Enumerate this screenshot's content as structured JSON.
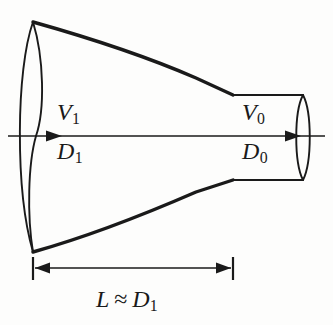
{
  "figure": {
    "background_color": "#fdfdfc",
    "line_color": "#1a1a1a"
  },
  "labels": {
    "inlet_velocity": {
      "symbol": "V",
      "subscript": "1",
      "text": "V1"
    },
    "inlet_diameter": {
      "symbol": "D",
      "subscript": "1",
      "text": "D1"
    },
    "outlet_velocity": {
      "symbol": "V",
      "subscript": "0",
      "text": "V0"
    },
    "outlet_diameter": {
      "symbol": "D",
      "subscript": "0",
      "text": "D0"
    },
    "length_relation": {
      "symbol": "L",
      "operator": "≈",
      "rhs_symbol": "D",
      "rhs_subscript": "1",
      "text": "L ≈ D1"
    }
  },
  "icons": {
    "flow_arrow_left": "arrow-right-icon",
    "flow_arrow_right": "arrow-right-icon",
    "dimension_arrow_left": "arrow-left-icon",
    "dimension_arrow_right": "arrow-right-icon"
  },
  "geometry": {
    "centerline_y": 136,
    "centerline_x_start": 8,
    "centerline_x_end": 325,
    "inlet_x": 33,
    "inlet_top_y": 22,
    "inlet_bottom_y": 252,
    "outlet_x_start": 233,
    "outlet_x_end": 305,
    "outlet_top_y": 95,
    "outlet_bottom_y": 180,
    "dimension_line_y": 268,
    "dimension_x_start": 33,
    "dimension_x_end": 233
  }
}
